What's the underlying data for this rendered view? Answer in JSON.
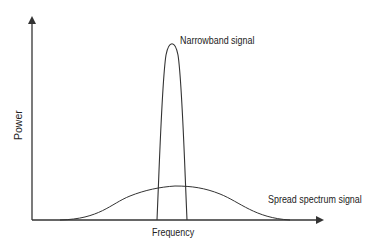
{
  "diagram": {
    "axes": {
      "x_label": "Frequency",
      "y_label": "Power"
    },
    "curves": [
      {
        "name": "narrowband",
        "label": "Narrowband signal",
        "shape": "tall narrow peak"
      },
      {
        "name": "spread-spectrum",
        "label": "Spread spectrum signal",
        "shape": "low wide bell"
      }
    ],
    "colors": {
      "line": "#333333",
      "background": "#ffffff"
    }
  }
}
